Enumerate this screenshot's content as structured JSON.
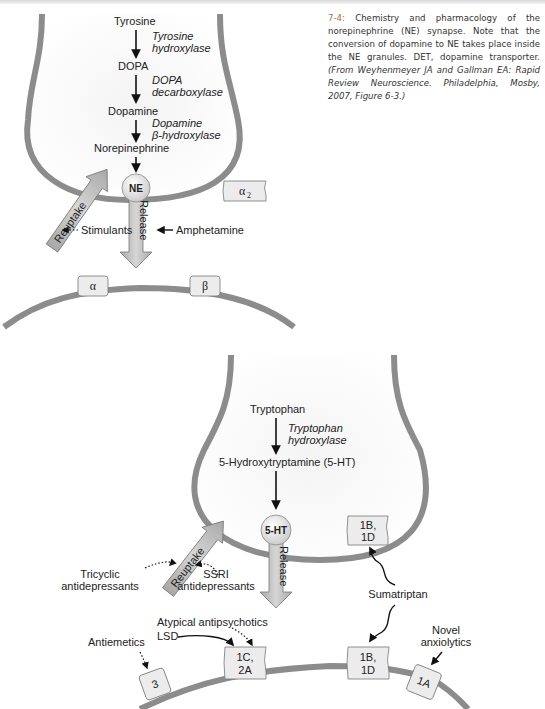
{
  "caption": {
    "figure_number": "7-4:",
    "text": " Chemistry and pharmacology of the norepinephrine (NE) synapse. Note that the conversion of dopamine to NE takes place inside the NE granules. DET, dopamine transporter. ",
    "source": "(From Weyhenmeyer JA and Gallman EA: Rapid Review Neuroscience. Philadelphia, Mosby, 2007, Figure 6-3.)"
  },
  "ne_synapse": {
    "pathway": [
      {
        "substance": "Tyrosine",
        "enzyme_line1": "Tyrosine",
        "enzyme_line2": "hydroxylase"
      },
      {
        "substance": "DOPA",
        "enzyme_line1": "DOPA",
        "enzyme_line2": "decarboxylase"
      },
      {
        "substance": "Dopamine",
        "enzyme_line1": "Dopamine",
        "enzyme_line2": "β-hydroxylase"
      },
      {
        "substance": "Norepinephrine"
      }
    ],
    "vesicle_label": "NE",
    "release_label": "Release",
    "reuptake_label": "Reuptake",
    "drugs": {
      "stimulants": "Stimulants",
      "amphetamine": "Amphetamine"
    },
    "receptors": {
      "presynaptic": "α",
      "presynaptic_sub": "2",
      "post_alpha": "α",
      "post_beta": "β"
    }
  },
  "ht_synapse": {
    "pathway": [
      {
        "substance": "Tryptophan",
        "enzyme_line1": "Tryptophan",
        "enzyme_line2": "hydroxylase"
      },
      {
        "substance": "5-Hydroxytryptamine (5-HT)"
      }
    ],
    "vesicle_label": "5-HT",
    "release_label": "Release",
    "reuptake_label": "Reuptake",
    "drugs": {
      "tricyclic_line1": "Tricyclic",
      "tricyclic_line2": "antidepressants",
      "ssri_line1": "SSRI",
      "ssri_line2": "antidepressants",
      "sumatriptan": "Sumatriptan",
      "atypical": "Atypical antipsychotics",
      "lsd": "LSD",
      "antiemetics": "Antiemetics",
      "novel_line1": "Novel",
      "novel_line2": "anxiolytics"
    },
    "receptors": {
      "pre_1b1d_line1": "1B,",
      "pre_1b1d_line2": "1D",
      "post_3": "3",
      "post_1c2a_line1": "1C,",
      "post_1c2a_line2": "2A",
      "post_1b1d_line1": "1B,",
      "post_1b1d_line2": "1D",
      "post_1a": "1A"
    }
  },
  "colors": {
    "membrane": "#8c8c8c",
    "arrow_fill": "#bdbdbd",
    "receptor_fill": "#ececec",
    "caption_accent": "#b06a3a"
  }
}
